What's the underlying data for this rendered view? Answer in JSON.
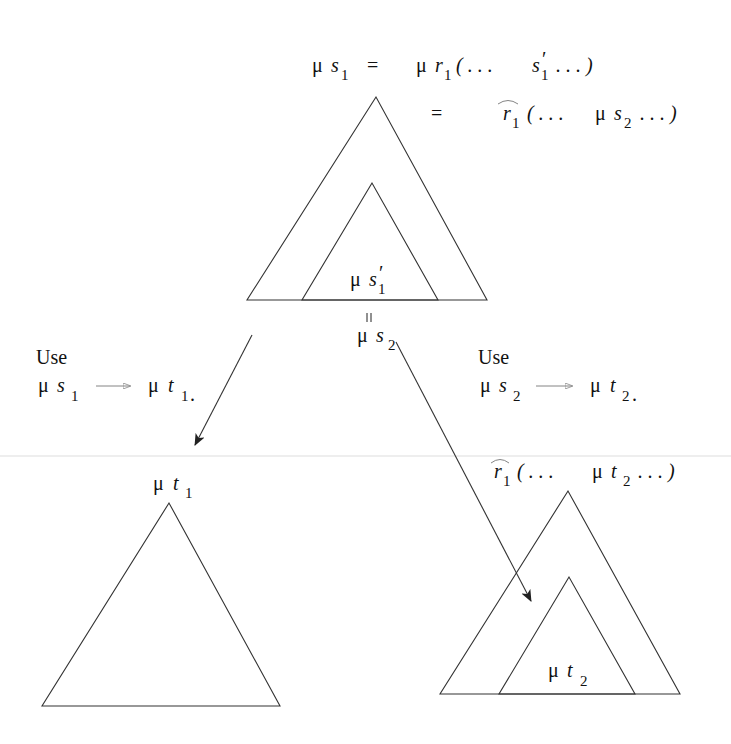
{
  "diagram": {
    "top": {
      "eq1": {
        "lhs_mu": "μ",
        "lhs_var": "s",
        "lhs_sub": "1",
        "eq": "=",
        "rhs_mu": "μ",
        "rhs_var": "r",
        "rhs_sub": "1",
        "open": "( . . .",
        "inner_var": "s",
        "inner_prime": "′",
        "inner_sub": "1",
        "close": ". . . )"
      },
      "eq2": {
        "eq": "=",
        "hat_var": "r",
        "hat_sub": "1",
        "open": "( . . .",
        "mu": "μ",
        "var": "s",
        "sub": "2",
        "close": ". . . )"
      },
      "inner_label": {
        "mu": "μ",
        "var": "s",
        "prime": "′",
        "sub": "1"
      },
      "equals_vertical": "=",
      "below_label": {
        "mu": "μ",
        "var": "s",
        "sub": "2"
      }
    },
    "left_step": {
      "use": "Use",
      "from": {
        "mu": "μ",
        "var": "s",
        "sub": "1"
      },
      "to": {
        "mu": "μ",
        "var": "t",
        "sub": "1"
      },
      "period": "."
    },
    "right_step": {
      "use": "Use",
      "from": {
        "mu": "μ",
        "var": "s",
        "sub": "2"
      },
      "to": {
        "mu": "μ",
        "var": "t",
        "sub": "2"
      },
      "period": "."
    },
    "bottom_left": {
      "label": {
        "mu": "μ",
        "var": "t",
        "sub": "1"
      }
    },
    "bottom_right": {
      "top_label": {
        "hat_var": "r",
        "hat_sub": "1",
        "open": "( . . .",
        "mu": "μ",
        "var": "t",
        "sub": "2",
        "close": ". . . )"
      },
      "inner_label": {
        "mu": "μ",
        "var": "t",
        "sub": "2"
      }
    }
  }
}
